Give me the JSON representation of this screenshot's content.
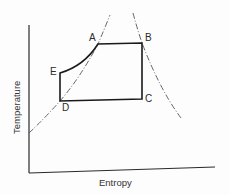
{
  "diagram": {
    "type": "temperature-entropy (T-s) cycle diagram",
    "xlabel": "Entropy",
    "ylabel": "Temperature",
    "colors": {
      "cycle": "#1a1a1a",
      "saturation_dome": "#555555",
      "axis": "#2a2a2a",
      "background": "#fdfdfd"
    },
    "points": [
      {
        "id": "A",
        "label": "A",
        "x": 98,
        "y": 44
      },
      {
        "id": "B",
        "label": "B",
        "x": 142,
        "y": 43
      },
      {
        "id": "C",
        "label": "C",
        "x": 142,
        "y": 99
      },
      {
        "id": "D",
        "label": "D",
        "x": 60,
        "y": 101
      },
      {
        "id": "E",
        "label": "E",
        "x": 60,
        "y": 73
      }
    ],
    "cycle_path": [
      "E",
      "A",
      "B",
      "C",
      "D",
      "E"
    ],
    "dome": {
      "left_branch": "saturated liquid line (dash-dot)",
      "right_branch": "saturated vapour line (dash-dot)"
    }
  }
}
